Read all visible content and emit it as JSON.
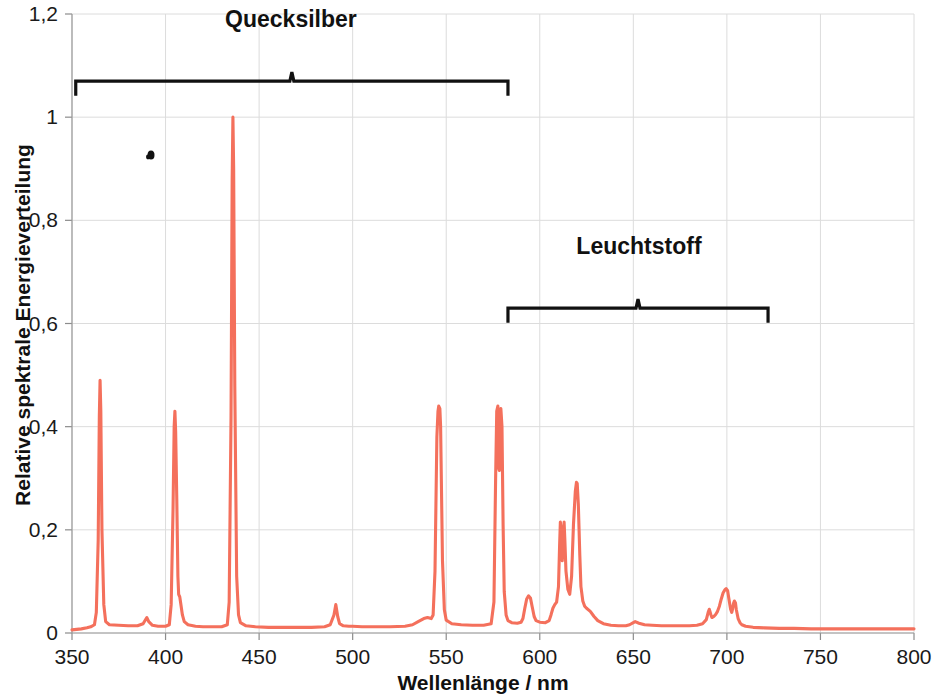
{
  "chart_data": {
    "type": "line",
    "title": "",
    "xlabel": "Wellenlänge / nm",
    "ylabel": "Relative spektrale Energieverteilung",
    "xlim": [
      350,
      800
    ],
    "ylim": [
      0,
      1.2
    ],
    "grid": true,
    "legend": "none",
    "line_color": "#f4705c",
    "xticks": [
      350,
      400,
      450,
      500,
      550,
      600,
      650,
      700,
      750,
      800
    ],
    "xtick_labels": [
      "350",
      "400",
      "450",
      "500",
      "550",
      "600",
      "650",
      "700",
      "750",
      "800"
    ],
    "yticks": [
      0,
      0.2,
      0.4,
      0.6,
      0.8,
      1.0,
      1.2
    ],
    "ytick_labels": [
      "0",
      "0,2",
      "0,4",
      "0,6",
      "0,8",
      "1",
      "1,2"
    ],
    "series": [
      {
        "name": "Leuchtstofflampen-Spektrum",
        "points": [
          [
            350,
            0.006
          ],
          [
            355,
            0.008
          ],
          [
            358,
            0.01
          ],
          [
            360,
            0.012
          ],
          [
            362,
            0.016
          ],
          [
            363,
            0.04
          ],
          [
            364,
            0.18
          ],
          [
            364.6,
            0.42
          ],
          [
            365,
            0.49
          ],
          [
            365.4,
            0.43
          ],
          [
            366,
            0.2
          ],
          [
            367,
            0.055
          ],
          [
            368,
            0.022
          ],
          [
            370,
            0.016
          ],
          [
            375,
            0.015
          ],
          [
            380,
            0.014
          ],
          [
            385,
            0.014
          ],
          [
            388,
            0.018
          ],
          [
            390,
            0.03
          ],
          [
            391,
            0.022
          ],
          [
            393,
            0.015
          ],
          [
            396,
            0.013
          ],
          [
            400,
            0.013
          ],
          [
            402,
            0.016
          ],
          [
            403,
            0.055
          ],
          [
            404,
            0.24
          ],
          [
            404.6,
            0.4
          ],
          [
            405,
            0.43
          ],
          [
            405.4,
            0.39
          ],
          [
            406,
            0.26
          ],
          [
            406.6,
            0.11
          ],
          [
            407,
            0.075
          ],
          [
            407.6,
            0.07
          ],
          [
            408,
            0.06
          ],
          [
            409,
            0.035
          ],
          [
            410,
            0.022
          ],
          [
            412,
            0.016
          ],
          [
            416,
            0.013
          ],
          [
            420,
            0.012
          ],
          [
            425,
            0.012
          ],
          [
            430,
            0.012
          ],
          [
            433,
            0.016
          ],
          [
            434,
            0.06
          ],
          [
            435,
            0.42
          ],
          [
            435.6,
            0.88
          ],
          [
            436,
            1.0
          ],
          [
            436.4,
            0.9
          ],
          [
            437,
            0.48
          ],
          [
            438,
            0.11
          ],
          [
            439,
            0.035
          ],
          [
            440,
            0.02
          ],
          [
            443,
            0.014
          ],
          [
            448,
            0.012
          ],
          [
            455,
            0.011
          ],
          [
            462,
            0.011
          ],
          [
            470,
            0.011
          ],
          [
            478,
            0.011
          ],
          [
            485,
            0.012
          ],
          [
            488,
            0.016
          ],
          [
            490,
            0.035
          ],
          [
            491,
            0.055
          ],
          [
            492,
            0.032
          ],
          [
            493,
            0.018
          ],
          [
            495,
            0.014
          ],
          [
            498,
            0.013
          ],
          [
            500,
            0.013
          ],
          [
            505,
            0.012
          ],
          [
            512,
            0.012
          ],
          [
            520,
            0.012
          ],
          [
            528,
            0.013
          ],
          [
            532,
            0.016
          ],
          [
            535,
            0.022
          ],
          [
            538,
            0.028
          ],
          [
            540,
            0.03
          ],
          [
            542,
            0.028
          ],
          [
            543,
            0.035
          ],
          [
            544,
            0.12
          ],
          [
            545,
            0.38
          ],
          [
            545.6,
            0.43
          ],
          [
            546,
            0.44
          ],
          [
            546.6,
            0.435
          ],
          [
            547,
            0.4
          ],
          [
            548,
            0.14
          ],
          [
            549,
            0.045
          ],
          [
            550,
            0.025
          ],
          [
            553,
            0.018
          ],
          [
            558,
            0.016
          ],
          [
            564,
            0.015
          ],
          [
            570,
            0.015
          ],
          [
            574,
            0.018
          ],
          [
            575.5,
            0.06
          ],
          [
            576.4,
            0.3
          ],
          [
            577,
            0.43
          ],
          [
            577.6,
            0.44
          ],
          [
            578,
            0.32
          ],
          [
            578.4,
            0.315
          ],
          [
            578.8,
            0.42
          ],
          [
            579.2,
            0.435
          ],
          [
            579.8,
            0.4
          ],
          [
            580.4,
            0.21
          ],
          [
            581,
            0.08
          ],
          [
            582,
            0.035
          ],
          [
            583,
            0.024
          ],
          [
            585,
            0.02
          ],
          [
            588,
            0.019
          ],
          [
            590,
            0.021
          ],
          [
            591,
            0.028
          ],
          [
            592,
            0.048
          ],
          [
            593,
            0.066
          ],
          [
            594,
            0.072
          ],
          [
            595,
            0.068
          ],
          [
            596,
            0.05
          ],
          [
            597,
            0.032
          ],
          [
            598,
            0.024
          ],
          [
            600,
            0.021
          ],
          [
            603,
            0.02
          ],
          [
            605,
            0.024
          ],
          [
            606,
            0.035
          ],
          [
            607,
            0.048
          ],
          [
            608,
            0.055
          ],
          [
            609,
            0.06
          ],
          [
            610,
            0.09
          ],
          [
            610.6,
            0.17
          ],
          [
            611,
            0.215
          ],
          [
            611.6,
            0.2
          ],
          [
            612,
            0.14
          ],
          [
            612.6,
            0.17
          ],
          [
            613,
            0.215
          ],
          [
            613.4,
            0.18
          ],
          [
            614,
            0.12
          ],
          [
            615,
            0.085
          ],
          [
            616,
            0.075
          ],
          [
            617,
            0.11
          ],
          [
            618,
            0.21
          ],
          [
            619,
            0.275
          ],
          [
            619.6,
            0.292
          ],
          [
            620,
            0.29
          ],
          [
            620.6,
            0.25
          ],
          [
            621.4,
            0.15
          ],
          [
            622,
            0.09
          ],
          [
            623,
            0.062
          ],
          [
            624,
            0.052
          ],
          [
            625,
            0.048
          ],
          [
            627,
            0.042
          ],
          [
            629,
            0.032
          ],
          [
            631,
            0.024
          ],
          [
            634,
            0.018
          ],
          [
            638,
            0.015
          ],
          [
            642,
            0.014
          ],
          [
            646,
            0.014
          ],
          [
            648,
            0.016
          ],
          [
            650,
            0.02
          ],
          [
            651,
            0.022
          ],
          [
            653,
            0.019
          ],
          [
            656,
            0.016
          ],
          [
            660,
            0.015
          ],
          [
            665,
            0.014
          ],
          [
            670,
            0.014
          ],
          [
            675,
            0.014
          ],
          [
            680,
            0.014
          ],
          [
            684,
            0.015
          ],
          [
            687,
            0.018
          ],
          [
            689,
            0.026
          ],
          [
            690,
            0.04
          ],
          [
            690.6,
            0.046
          ],
          [
            691.4,
            0.036
          ],
          [
            692,
            0.03
          ],
          [
            693,
            0.032
          ],
          [
            694,
            0.036
          ],
          [
            695,
            0.042
          ],
          [
            696,
            0.052
          ],
          [
            697,
            0.066
          ],
          [
            698,
            0.078
          ],
          [
            699,
            0.084
          ],
          [
            699.6,
            0.086
          ],
          [
            700.4,
            0.082
          ],
          [
            701,
            0.068
          ],
          [
            702,
            0.046
          ],
          [
            702.6,
            0.04
          ],
          [
            703,
            0.046
          ],
          [
            703.6,
            0.058
          ],
          [
            704,
            0.062
          ],
          [
            704.6,
            0.058
          ],
          [
            705,
            0.046
          ],
          [
            706,
            0.028
          ],
          [
            707,
            0.02
          ],
          [
            708,
            0.016
          ],
          [
            710,
            0.013
          ],
          [
            714,
            0.011
          ],
          [
            720,
            0.01
          ],
          [
            728,
            0.009
          ],
          [
            736,
            0.009
          ],
          [
            745,
            0.008
          ],
          [
            755,
            0.008
          ],
          [
            765,
            0.008
          ],
          [
            775,
            0.008
          ],
          [
            785,
            0.008
          ],
          [
            795,
            0.008
          ],
          [
            800,
            0.008
          ]
        ]
      }
    ],
    "annotations": [
      {
        "name": "quecksilber",
        "label": "Quecksilber",
        "x_start": 352,
        "x_end": 583,
        "y": 1.07,
        "label_x": 467,
        "label_y": 1.175
      },
      {
        "name": "leuchtstoff",
        "label": "Leuchtstoff",
        "x_start": 583,
        "x_end": 722,
        "y": 0.63,
        "label_x": 653,
        "label_y": 0.735
      }
    ]
  }
}
